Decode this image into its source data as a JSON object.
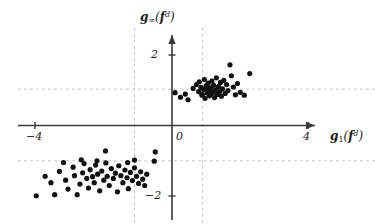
{
  "figure": {
    "background": "#ffffff",
    "axis_color": "#3a3a3a",
    "grid_color": "#c8c8c8",
    "point_color": "#111111"
  },
  "axes": {
    "x_label_main": "g",
    "x_label_sub": "1",
    "x_label_arg_bold": "f",
    "x_label_arg_sup": "d",
    "y_label_main": "g",
    "y_label_sub": "∞",
    "y_label_arg_bold": "f",
    "y_label_arg_sup": "d",
    "x_ticks": [
      "−4",
      "0",
      "4"
    ],
    "y_ticks": [
      "2",
      "−2"
    ],
    "x_range": [
      -4.9,
      4.7
    ],
    "y_range": [
      -2.4,
      2.4
    ],
    "gridlines_x": [
      -1.1,
      0.9
    ],
    "gridlines_y": [
      1.03,
      -1.0
    ],
    "grid_style": "dashed",
    "origin_px": [
      172,
      125.5
    ],
    "scale_px_per_unit": [
      34.1,
      35.3
    ]
  },
  "chart_data": {
    "type": "scatter",
    "title": "",
    "xlabel": "g_1(f^d)",
    "ylabel": "g_inf(f^d)",
    "xlim": [
      -4.9,
      4.7
    ],
    "ylim": [
      -2.4,
      2.4
    ],
    "grid": true,
    "legend": "none",
    "marker": "filled-circle",
    "marker_size_px": 4,
    "series": [
      {
        "name": "samples",
        "points": [
          [
            0.09,
            0.93
          ],
          [
            0.25,
            0.8
          ],
          [
            0.39,
            0.89
          ],
          [
            0.47,
            0.73
          ],
          [
            0.62,
            1.05
          ],
          [
            0.72,
            1.16
          ],
          [
            0.78,
            0.96
          ],
          [
            0.8,
            1.24
          ],
          [
            0.85,
            1.08
          ],
          [
            0.88,
            0.86
          ],
          [
            0.93,
            1.02
          ],
          [
            0.95,
            1.3
          ],
          [
            0.97,
            0.77
          ],
          [
            1.0,
            1.12
          ],
          [
            1.03,
            0.92
          ],
          [
            1.06,
            1.2
          ],
          [
            1.08,
            0.99
          ],
          [
            1.1,
            0.84
          ],
          [
            1.13,
            1.07
          ],
          [
            1.15,
            0.9
          ],
          [
            1.17,
            1.26
          ],
          [
            1.2,
            0.95
          ],
          [
            1.22,
            1.14
          ],
          [
            1.25,
            0.79
          ],
          [
            1.27,
            1.01
          ],
          [
            1.3,
            1.35
          ],
          [
            1.33,
            0.88
          ],
          [
            1.36,
            1.1
          ],
          [
            1.4,
            0.97
          ],
          [
            1.42,
            1.22
          ],
          [
            1.45,
            0.83
          ],
          [
            1.48,
            1.04
          ],
          [
            1.52,
            1.28
          ],
          [
            1.56,
            0.91
          ],
          [
            1.6,
            1.16
          ],
          [
            1.64,
            0.99
          ],
          [
            1.7,
            1.72
          ],
          [
            1.74,
            1.41
          ],
          [
            1.8,
            1.09
          ],
          [
            1.86,
            0.87
          ],
          [
            1.92,
            1.19
          ],
          [
            2.0,
            0.94
          ],
          [
            2.12,
            0.86
          ],
          [
            2.28,
            1.47
          ],
          [
            0.88,
            0.88
          ],
          [
            1.05,
            1.05
          ],
          [
            1.18,
            0.93
          ],
          [
            -1.1,
            -0.98
          ],
          [
            -0.49,
            -0.75
          ],
          [
            -0.52,
            -1.01
          ],
          [
            -3.98,
            -1.99
          ],
          [
            -3.44,
            -1.96
          ],
          [
            -3.55,
            -1.62
          ],
          [
            -3.72,
            -1.44
          ],
          [
            -3.3,
            -1.3
          ],
          [
            -3.12,
            -1.55
          ],
          [
            -3.05,
            -1.8
          ],
          [
            -2.9,
            -1.18
          ],
          [
            -2.86,
            -1.42
          ],
          [
            -2.78,
            -1.96
          ],
          [
            -2.7,
            -1.66
          ],
          [
            -2.62,
            -1.34
          ],
          [
            -2.58,
            -1.08
          ],
          [
            -2.5,
            -1.5
          ],
          [
            -2.45,
            -1.77
          ],
          [
            -2.4,
            -1.25
          ],
          [
            -2.33,
            -1.45
          ],
          [
            -2.28,
            -1.62
          ],
          [
            -2.24,
            -1.12
          ],
          [
            -2.18,
            -1.38
          ],
          [
            -2.12,
            -1.85
          ],
          [
            -2.06,
            -1.29
          ],
          [
            -2.0,
            -1.55
          ],
          [
            -1.94,
            -1.06
          ],
          [
            -1.9,
            -1.44
          ],
          [
            -1.84,
            -1.7
          ],
          [
            -1.78,
            -1.22
          ],
          [
            -1.72,
            -1.5
          ],
          [
            -1.66,
            -1.35
          ],
          [
            -1.6,
            -1.88
          ],
          [
            -1.56,
            -1.14
          ],
          [
            -1.5,
            -1.42
          ],
          [
            -1.44,
            -1.62
          ],
          [
            -1.38,
            -1.26
          ],
          [
            -1.32,
            -1.48
          ],
          [
            -1.28,
            -1.79
          ],
          [
            -1.22,
            -1.33
          ],
          [
            -1.16,
            -1.56
          ],
          [
            -1.1,
            -1.2
          ],
          [
            -1.04,
            -1.44
          ],
          [
            -0.98,
            -1.64
          ],
          [
            -0.92,
            -1.31
          ],
          [
            -0.86,
            -1.52
          ],
          [
            -0.8,
            -1.7
          ],
          [
            -0.74,
            -1.38
          ],
          [
            -2.66,
            -0.97
          ],
          [
            -3.18,
            -1.05
          ],
          [
            -2.2,
            -1.0
          ],
          [
            -1.95,
            -0.72
          ],
          [
            -1.3,
            -1.05
          ]
        ]
      }
    ]
  }
}
